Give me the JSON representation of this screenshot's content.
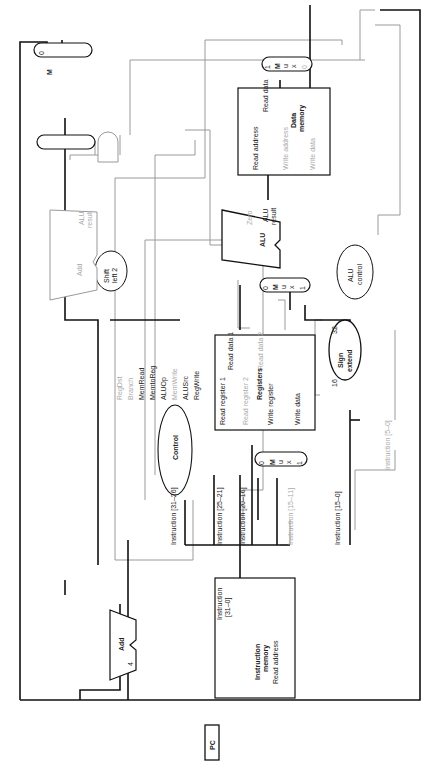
{
  "diagram": {
    "blocks": {
      "pc": "PC",
      "add_pc": "Add",
      "constant_4": "4",
      "instruction_memory": {
        "port_in": "Read address",
        "port_out_1": "Instruction",
        "port_out_2": "[31–0]",
        "name_1": "Instruction",
        "name_2": "memory"
      },
      "control": "Control",
      "registers": {
        "name": "Registers",
        "read_reg1": "Read register 1",
        "read_reg2": "Read register 2",
        "write_reg": "Write register",
        "write_data": "Write data",
        "read_data1": "Read data 1",
        "read_data2": "Read data 2"
      },
      "sign_extend": {
        "line1": "Sign",
        "line2": "extend",
        "in_width": "16",
        "out_width": "32"
      },
      "alu_control": {
        "line1": "ALU",
        "line2": "control"
      },
      "alu": {
        "name": "ALU",
        "zero": "Zero",
        "result_1": "ALU",
        "result_2": "result"
      },
      "shift_left_2": {
        "line1": "Shift",
        "line2": "left 2"
      },
      "add_branch": {
        "name": "Add",
        "result_1": "ALU",
        "result_2": "result"
      },
      "data_memory": {
        "name_1": "Data",
        "name_2": "memory",
        "read_address": "Read address",
        "write_address": "Write address",
        "write_data": "Write data",
        "read_data": "Read data"
      },
      "mux_label": [
        "M",
        "u",
        "x"
      ],
      "mux_in0": "0",
      "mux_in1": "1"
    },
    "control_signals": [
      "RegDst",
      "Branch",
      "MemRead",
      "MemtoReg",
      "ALUOp",
      "MemWrite",
      "ALUSrc",
      "RegWrite"
    ],
    "instruction_fields": [
      "Instruction [31–26]",
      "Instruction [25–21]",
      "Instruction [20–16]",
      "Instruction [15–11]",
      "Instruction [15–0]",
      "Instruction [5–0]"
    ]
  }
}
